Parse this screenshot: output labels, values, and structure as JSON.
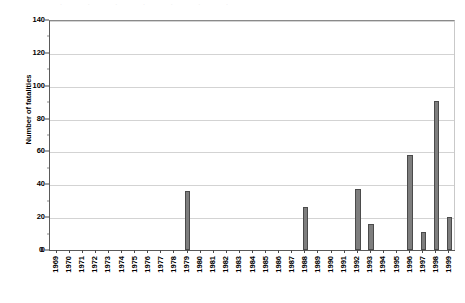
{
  "chart_data": {
    "type": "bar",
    "title": "",
    "subtitle": "",
    "xlabel": "",
    "ylabel": "Number of fatalities",
    "ylim": [
      0,
      140
    ],
    "ytick_labels": [
      "0",
      "20",
      "40",
      "60",
      "80",
      "100",
      "120",
      "140"
    ],
    "ytick_values": [
      0,
      20,
      40,
      60,
      80,
      100,
      120,
      140
    ],
    "grid": "horizontal",
    "legend": "none",
    "bar_color": "#7e7e7e",
    "bar_border_color": "#4b4b4b",
    "gridline_color": "#d3d3d3",
    "axis_color": "#5a5a5a",
    "categories": [
      "1969",
      "1970",
      "1971",
      "1972",
      "1973",
      "1974",
      "1975",
      "1976",
      "1977",
      "1978",
      "1979",
      "1980",
      "1981",
      "1982",
      "1983",
      "1984",
      "1985",
      "1986",
      "1987",
      "1988",
      "1989",
      "1990",
      "1991",
      "1992",
      "1993",
      "1994",
      "1995",
      "1996",
      "1997",
      "1998",
      "1999"
    ],
    "values": [
      0,
      0,
      0,
      0,
      0,
      0,
      0,
      0,
      0,
      0,
      36,
      0,
      0,
      0,
      0,
      0,
      0,
      0,
      0,
      26,
      0,
      0,
      0,
      37,
      16,
      0,
      0,
      58,
      11,
      91,
      20
    ]
  },
  "artifact": {
    "top_text": "·  ·  ·  ·  ·  ·  ·"
  }
}
